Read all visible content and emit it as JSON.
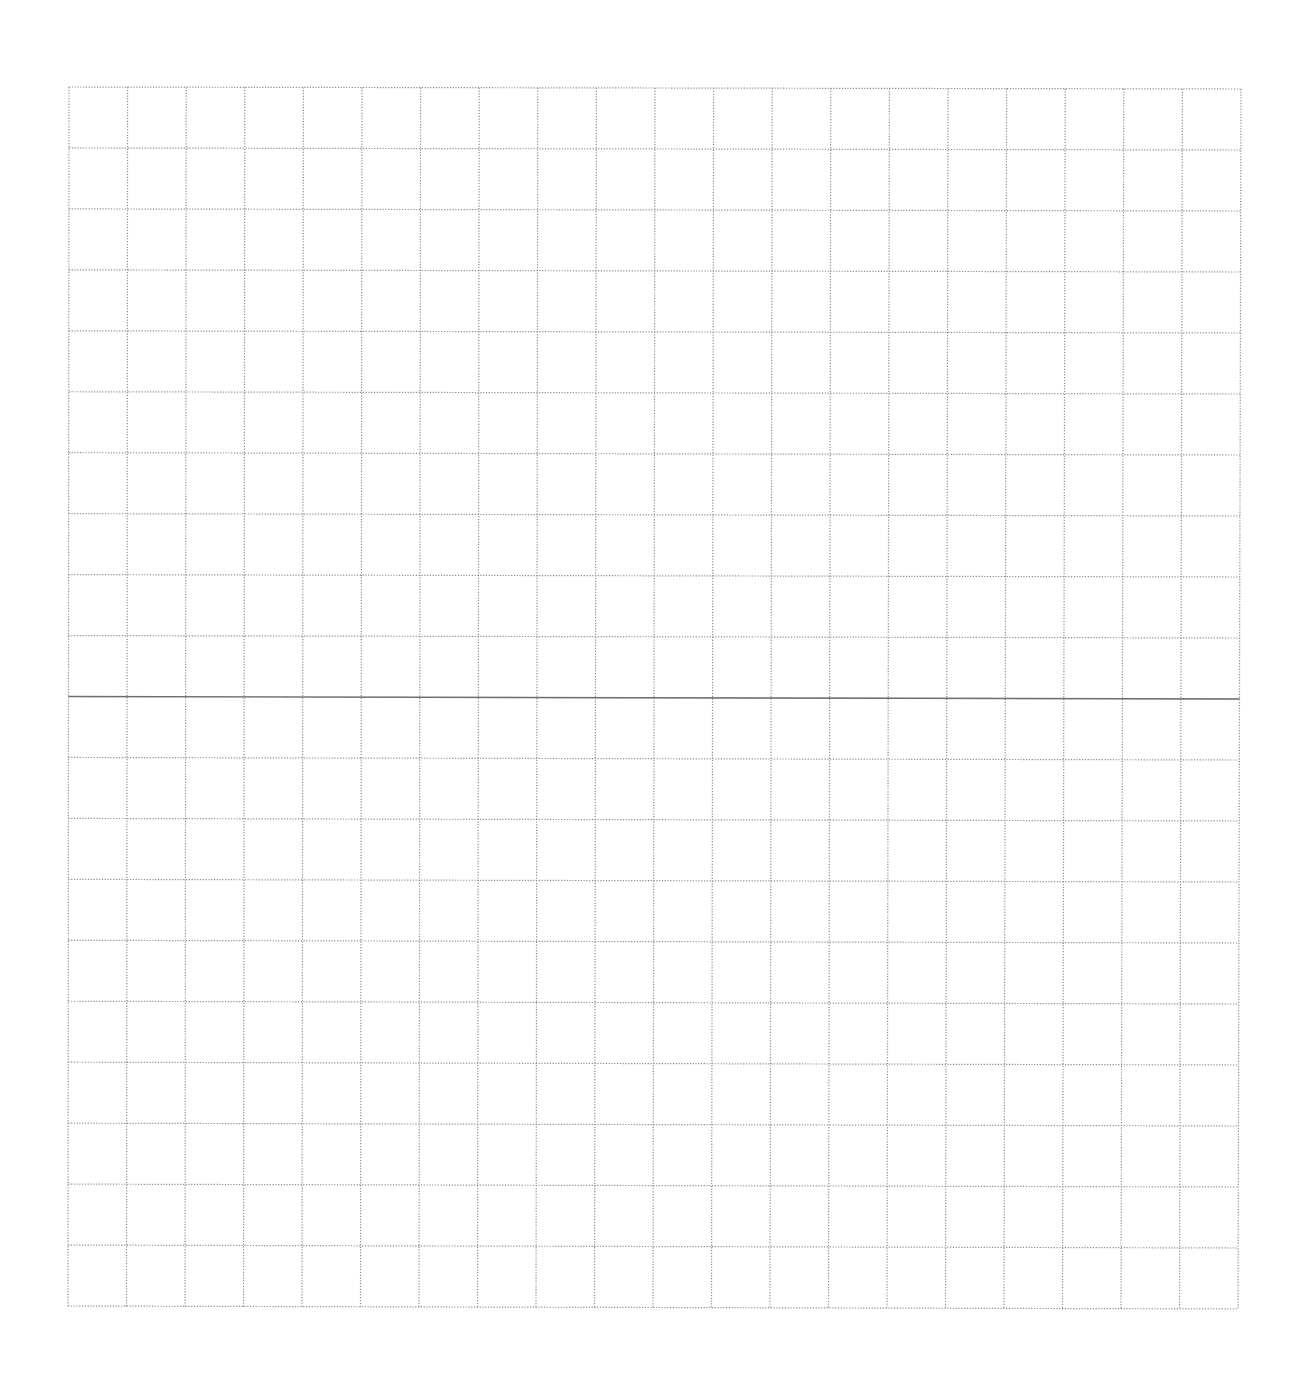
{
  "document": {
    "type": "grid-paper",
    "background_color": "#ffffff"
  },
  "grid": {
    "columns": 20,
    "rows": 20,
    "top_left": [
      69,
      87
    ],
    "top_right": [
      1241,
      89
    ],
    "bottom_left": [
      68,
      1306
    ],
    "bottom_right": [
      1238,
      1309
    ],
    "line_color": "#8c8c8c",
    "line_style": "dotted",
    "line_width": 1.2
  },
  "axis_line": {
    "row_index": 10,
    "color": "#6e6e6e",
    "line_style": "solid",
    "line_width": 1.4
  }
}
